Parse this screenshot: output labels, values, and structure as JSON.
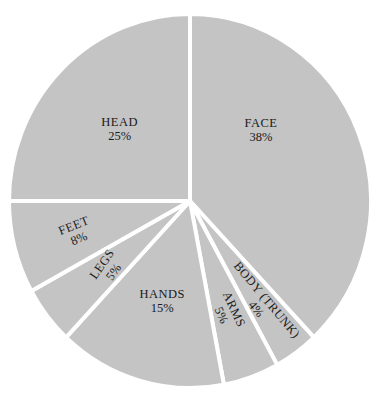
{
  "chart_data": {
    "type": "pie",
    "title": "",
    "clipped_title_fragment": "",
    "start_angle_deg": 0,
    "direction": "clockwise",
    "fill_color": "#c4c4c4",
    "separator_color": "#ffffff",
    "text_color": "#1a1a1a",
    "slices": [
      {
        "label": "FACE",
        "value": 38,
        "display": "38%"
      },
      {
        "label": "BODY (TRUNK)",
        "value": 4,
        "display": "4%"
      },
      {
        "label": "ARMS",
        "value": 5,
        "display": "5%"
      },
      {
        "label": "HANDS",
        "value": 15,
        "display": "15%"
      },
      {
        "label": "LEGS",
        "value": 5,
        "display": "5%"
      },
      {
        "label": "FEET",
        "value": 8,
        "display": "8%"
      },
      {
        "label": "HEAD",
        "value": 25,
        "display": "25%"
      }
    ],
    "categories": [
      "FACE",
      "BODY (TRUNK)",
      "ARMS",
      "HANDS",
      "LEGS",
      "FEET",
      "HEAD"
    ],
    "values": [
      38,
      4,
      5,
      15,
      5,
      8,
      25
    ],
    "legend": null
  }
}
